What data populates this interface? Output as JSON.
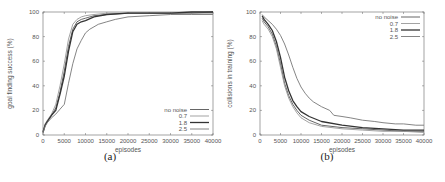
{
  "chart_data": [
    {
      "type": "line",
      "caption": "(a)",
      "title": "",
      "xlabel": "episodes",
      "ylabel": "goal finding success (%)",
      "xlim": [
        0,
        40000
      ],
      "ylim": [
        0,
        100
      ],
      "xticks": [
        0,
        5000,
        10000,
        15000,
        20000,
        25000,
        30000,
        35000,
        40000
      ],
      "yticks": [
        0,
        20,
        40,
        60,
        80,
        100
      ],
      "legend_position": "bottom-right",
      "grid": false,
      "series": [
        {
          "name": "no noise",
          "color": "#555555",
          "width": 0.9,
          "x": [
            0,
            500,
            1000,
            2000,
            3000,
            4000,
            5000,
            6000,
            7000,
            8000,
            9000,
            10000,
            12000,
            15000,
            20000,
            25000,
            30000,
            35000,
            40000
          ],
          "y": [
            3,
            8,
            11,
            16,
            22,
            35,
            52,
            72,
            86,
            92,
            94,
            95,
            97,
            98,
            99,
            99,
            99,
            99,
            100
          ]
        },
        {
          "name": "0.7",
          "color": "#999999",
          "width": 0.9,
          "x": [
            0,
            500,
            1000,
            2000,
            3000,
            4000,
            5000,
            6000,
            7000,
            8000,
            9000,
            10000,
            12000,
            15000,
            20000,
            25000,
            30000,
            35000,
            40000
          ],
          "y": [
            3,
            9,
            12,
            17,
            25,
            40,
            58,
            78,
            90,
            94,
            96,
            97,
            98,
            99,
            99,
            99,
            99,
            99,
            99
          ]
        },
        {
          "name": "1.8",
          "color": "#333333",
          "width": 1.3,
          "x": [
            0,
            500,
            1000,
            2000,
            3000,
            4000,
            5000,
            6000,
            7000,
            8000,
            9000,
            10000,
            12000,
            15000,
            20000,
            25000,
            30000,
            35000,
            40000
          ],
          "y": [
            2,
            8,
            11,
            16,
            20,
            33,
            48,
            68,
            84,
            90,
            92,
            93,
            96,
            98,
            99,
            99,
            99,
            100,
            100
          ]
        },
        {
          "name": "2.5",
          "color": "#777777",
          "width": 0.9,
          "x": [
            0,
            500,
            1000,
            2000,
            3000,
            4000,
            5000,
            6000,
            7000,
            8000,
            9000,
            10000,
            11000,
            12000,
            13000,
            15000,
            17000,
            20000,
            25000,
            30000,
            35000,
            40000
          ],
          "y": [
            2,
            7,
            10,
            14,
            17,
            21,
            25,
            42,
            58,
            70,
            77,
            83,
            86,
            88,
            90,
            92,
            94,
            96,
            97,
            98,
            98,
            98
          ]
        }
      ]
    },
    {
      "type": "line",
      "caption": "(b)",
      "title": "",
      "xlabel": "episodes",
      "ylabel": "collisions in training (%)",
      "xlim": [
        0,
        40000
      ],
      "ylim": [
        0,
        100
      ],
      "xticks": [
        0,
        5000,
        10000,
        15000,
        20000,
        25000,
        30000,
        35000,
        40000
      ],
      "yticks": [
        0,
        20,
        40,
        60,
        80,
        100
      ],
      "legend_position": "top-right",
      "grid": false,
      "series": [
        {
          "name": "no noise",
          "color": "#555555",
          "width": 0.9,
          "x": [
            500,
            1000,
            2000,
            3000,
            4000,
            5000,
            6000,
            7000,
            8000,
            9000,
            10000,
            12000,
            15000,
            20000,
            25000,
            30000,
            35000,
            40000
          ],
          "y": [
            95,
            92,
            88,
            82,
            72,
            58,
            42,
            32,
            25,
            20,
            16,
            12,
            8,
            6,
            5,
            4,
            3,
            3
          ]
        },
        {
          "name": "0.7",
          "color": "#999999",
          "width": 0.9,
          "x": [
            500,
            1000,
            2000,
            3000,
            4000,
            5000,
            6000,
            7000,
            8000,
            9000,
            10000,
            12000,
            15000,
            20000,
            25000,
            30000,
            35000,
            40000
          ],
          "y": [
            93,
            90,
            86,
            80,
            70,
            55,
            40,
            30,
            23,
            18,
            14,
            10,
            7,
            5,
            4,
            3,
            3,
            2
          ]
        },
        {
          "name": "1.8",
          "color": "#333333",
          "width": 1.3,
          "x": [
            500,
            1000,
            2000,
            3000,
            4000,
            5000,
            6000,
            7000,
            8000,
            9000,
            10000,
            12000,
            15000,
            20000,
            25000,
            30000,
            35000,
            40000
          ],
          "y": [
            97,
            94,
            90,
            85,
            76,
            63,
            47,
            36,
            28,
            23,
            19,
            15,
            11,
            8,
            6,
            5,
            4,
            4
          ]
        },
        {
          "name": "2.5",
          "color": "#777777",
          "width": 0.9,
          "x": [
            500,
            1000,
            2000,
            3000,
            4000,
            5000,
            6000,
            7000,
            8000,
            9000,
            10000,
            11000,
            12000,
            13000,
            15000,
            17000,
            18000,
            20000,
            22000,
            25000,
            28000,
            30000,
            33000,
            35000,
            38000,
            40000
          ],
          "y": [
            98,
            96,
            93,
            90,
            86,
            81,
            74,
            65,
            55,
            46,
            39,
            34,
            30,
            27,
            23,
            20,
            16,
            15,
            14,
            12,
            11,
            10,
            9,
            9,
            8,
            8
          ]
        }
      ]
    }
  ]
}
